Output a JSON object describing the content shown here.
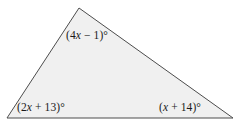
{
  "figure": {
    "type": "triangle-angle-diagram",
    "shape": "triangle",
    "fill_color": "#f0f0f0",
    "stroke_color": "#4d4d4d",
    "background_color": "#ffffff",
    "vertices": {
      "apex": {
        "x": 79,
        "y": 8
      },
      "bottom_left": {
        "x": 7,
        "y": 118
      },
      "bottom_right": {
        "x": 233,
        "y": 118
      }
    }
  },
  "labels": {
    "apex": {
      "full_text": "(4x − 1)°",
      "prefix": "(4",
      "variable": "x",
      "suffix": " − 1)°",
      "expression": "4x - 1",
      "unit": "degrees"
    },
    "bottom_left": {
      "full_text": "(2x + 13)°",
      "prefix": "(2",
      "variable": "x",
      "suffix": " + 13)°",
      "expression": "2x + 13",
      "unit": "degrees"
    },
    "bottom_right": {
      "full_text": "(x + 14)°",
      "prefix": "(",
      "variable": "x",
      "suffix": " + 14)°",
      "expression": "x + 14",
      "unit": "degrees"
    }
  }
}
